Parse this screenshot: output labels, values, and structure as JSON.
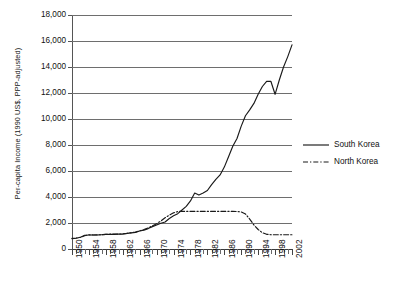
{
  "chart_data": {
    "type": "line",
    "title": "",
    "xlabel": "",
    "ylabel": "Per-capita Income (1990 US$, PPP-adjusted)",
    "xlim": [
      1950,
      2002
    ],
    "ylim": [
      0,
      18000
    ],
    "ytick_labels": [
      "18,000",
      "16,000",
      "14,000",
      "12,000",
      "10,000",
      "8,000",
      "6,000",
      "4,000",
      "2,000",
      "0"
    ],
    "ytick_values": [
      18000,
      16000,
      14000,
      12000,
      10000,
      8000,
      6000,
      4000,
      2000,
      0
    ],
    "xtick_labels": [
      "1950",
      "1954",
      "1958",
      "1962",
      "1966",
      "1970",
      "1974",
      "1978",
      "1982",
      "1986",
      "1990",
      "1994",
      "1998",
      "2002"
    ],
    "xtick_values": [
      1950,
      1954,
      1958,
      1962,
      1966,
      1970,
      1974,
      1978,
      1982,
      1986,
      1990,
      1994,
      1998,
      2002
    ],
    "grid": "horizontal",
    "legend_position": "right",
    "x": [
      1950,
      1951,
      1952,
      1953,
      1954,
      1955,
      1956,
      1957,
      1958,
      1959,
      1960,
      1961,
      1962,
      1963,
      1964,
      1965,
      1966,
      1967,
      1968,
      1969,
      1970,
      1971,
      1972,
      1973,
      1974,
      1975,
      1976,
      1977,
      1978,
      1979,
      1980,
      1981,
      1982,
      1983,
      1984,
      1985,
      1986,
      1987,
      1988,
      1989,
      1990,
      1991,
      1992,
      1993,
      1994,
      1995,
      1996,
      1997,
      1998,
      1999,
      2000,
      2001,
      2002
    ],
    "series": [
      {
        "name": "South Korea",
        "style": "solid",
        "color": "#1a1a1a",
        "values": [
          800,
          830,
          900,
          1060,
          1080,
          1080,
          1080,
          1100,
          1120,
          1130,
          1130,
          1150,
          1150,
          1200,
          1240,
          1280,
          1380,
          1450,
          1570,
          1720,
          1850,
          1980,
          2080,
          2350,
          2550,
          2720,
          3000,
          3280,
          3700,
          4300,
          4150,
          4300,
          4500,
          4950,
          5350,
          5700,
          6300,
          7100,
          7900,
          8500,
          9450,
          10250,
          10700,
          11200,
          11900,
          12500,
          12900,
          12900,
          11900,
          13000,
          14000,
          14800,
          15700
        ]
      },
      {
        "name": "North Korea",
        "style": "dash-dot",
        "color": "#1a1a1a",
        "values": [
          830,
          850,
          900,
          1020,
          1090,
          1080,
          1090,
          1100,
          1120,
          1140,
          1140,
          1150,
          1160,
          1200,
          1250,
          1300,
          1400,
          1500,
          1620,
          1780,
          1950,
          2150,
          2400,
          2600,
          2780,
          2880,
          2900,
          2900,
          2900,
          2900,
          2900,
          2900,
          2900,
          2900,
          2900,
          2900,
          2900,
          2900,
          2900,
          2880,
          2850,
          2700,
          2300,
          1850,
          1500,
          1250,
          1130,
          1100,
          1100,
          1100,
          1100,
          1100,
          1100
        ]
      }
    ],
    "annotations": []
  },
  "legend": {
    "items": [
      {
        "label": "South Korea",
        "style": "solid"
      },
      {
        "label": "North Korea",
        "style": "dash-dot"
      }
    ]
  }
}
